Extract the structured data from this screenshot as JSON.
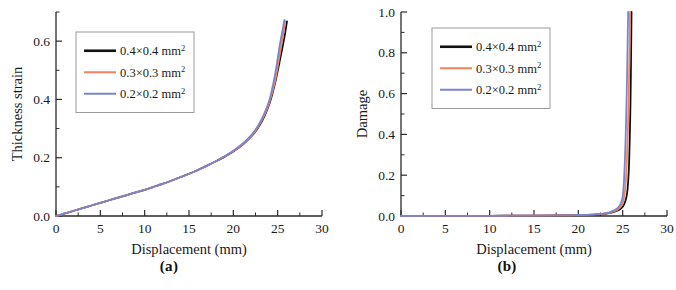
{
  "figure": {
    "panel_a_caption": "(a)",
    "panel_b_caption": "(b)"
  },
  "legend": {
    "entries": [
      {
        "base": "0.4×0.4 mm",
        "sup": "2",
        "color": "#111111"
      },
      {
        "base": "0.3×0.3 mm",
        "sup": "2",
        "color": "#f4825e"
      },
      {
        "base": "0.2×0.2 mm",
        "sup": "2",
        "color": "#7b85c9"
      }
    ]
  },
  "chart_data": [
    {
      "type": "line",
      "title": "",
      "panel": "(a)",
      "xlabel": "Displacement (mm)",
      "ylabel": "Thickness strain",
      "xlim": [
        0,
        30
      ],
      "ylim": [
        0,
        0.7
      ],
      "xticks": [
        0,
        5,
        10,
        15,
        20,
        25,
        30
      ],
      "xticklabels": [
        "0",
        "5",
        "10",
        "15",
        "20",
        "25",
        "30"
      ],
      "yticks": [
        0.0,
        0.2,
        0.4,
        0.6
      ],
      "yticklabels": [
        "0.0",
        "0.2",
        "0.4",
        "0.6"
      ],
      "x_minor_step": 2.5,
      "y_minor_step": 0.1,
      "grid": false,
      "legend_position": "upper left",
      "series": [
        {
          "name": "0.4×0.4 mm2",
          "color": "#111111",
          "x": [
            0,
            0.5,
            1,
            1.5,
            2,
            3,
            4,
            5,
            6,
            7,
            8,
            9,
            10,
            11,
            12,
            13,
            14,
            15,
            16,
            17,
            18,
            19,
            20,
            21,
            22,
            22.5,
            23,
            23.5,
            24,
            24.4,
            24.8,
            25.1,
            25.4,
            25.6,
            25.8,
            25.95,
            26.05
          ],
          "y": [
            0,
            0.004,
            0.009,
            0.013,
            0.018,
            0.027,
            0.036,
            0.045,
            0.054,
            0.063,
            0.072,
            0.081,
            0.09,
            0.1,
            0.11,
            0.121,
            0.133,
            0.145,
            0.158,
            0.172,
            0.187,
            0.203,
            0.221,
            0.243,
            0.272,
            0.29,
            0.313,
            0.342,
            0.379,
            0.419,
            0.468,
            0.512,
            0.557,
            0.588,
            0.62,
            0.648,
            0.668
          ]
        },
        {
          "name": "0.3×0.3 mm2",
          "color": "#f4825e",
          "x": [
            0,
            0.5,
            1,
            1.5,
            2,
            3,
            4,
            5,
            6,
            7,
            8,
            9,
            10,
            11,
            12,
            13,
            14,
            15,
            16,
            17,
            18,
            19,
            20,
            21,
            22,
            22.5,
            23,
            23.5,
            24,
            24.4,
            24.8,
            25.05,
            25.3,
            25.5,
            25.65,
            25.78,
            25.85
          ],
          "y": [
            0,
            0.004,
            0.009,
            0.013,
            0.018,
            0.027,
            0.036,
            0.045,
            0.054,
            0.063,
            0.072,
            0.081,
            0.09,
            0.1,
            0.11,
            0.121,
            0.133,
            0.145,
            0.158,
            0.172,
            0.187,
            0.204,
            0.222,
            0.244,
            0.274,
            0.292,
            0.316,
            0.346,
            0.384,
            0.425,
            0.476,
            0.521,
            0.567,
            0.601,
            0.629,
            0.655,
            0.669
          ]
        },
        {
          "name": "0.2×0.2 mm2",
          "color": "#7b85c9",
          "x": [
            0,
            0.5,
            1,
            1.5,
            2,
            3,
            4,
            5,
            6,
            7,
            8,
            9,
            10,
            11,
            12,
            13,
            14,
            15,
            16,
            17,
            18,
            19,
            20,
            21,
            22,
            22.5,
            23,
            23.5,
            24,
            24.35,
            24.7,
            24.95,
            25.18,
            25.38,
            25.55,
            25.68,
            25.76
          ],
          "y": [
            0,
            0.004,
            0.009,
            0.013,
            0.018,
            0.027,
            0.036,
            0.045,
            0.054,
            0.063,
            0.072,
            0.081,
            0.09,
            0.1,
            0.11,
            0.121,
            0.133,
            0.145,
            0.158,
            0.173,
            0.188,
            0.205,
            0.224,
            0.247,
            0.277,
            0.296,
            0.321,
            0.352,
            0.391,
            0.432,
            0.484,
            0.53,
            0.576,
            0.61,
            0.637,
            0.66,
            0.672
          ]
        }
      ]
    },
    {
      "type": "line",
      "title": "",
      "panel": "(b)",
      "xlabel": "Displacement (mm)",
      "ylabel": "Damage",
      "xlim": [
        0,
        30
      ],
      "ylim": [
        0,
        1.0
      ],
      "xticks": [
        0,
        5,
        10,
        15,
        20,
        25,
        30
      ],
      "xticklabels": [
        "0",
        "5",
        "10",
        "15",
        "20",
        "25",
        "30"
      ],
      "yticks": [
        0.0,
        0.2,
        0.4,
        0.6,
        0.8,
        1.0
      ],
      "yticklabels": [
        "0.0",
        "0.2",
        "0.4",
        "0.6",
        "0.8",
        "1.0"
      ],
      "x_minor_step": 2.5,
      "y_minor_step": 0.1,
      "grid": false,
      "legend_position": "upper left",
      "series": [
        {
          "name": "0.4×0.4 mm2",
          "color": "#111111",
          "x": [
            0,
            5,
            10,
            15,
            18,
            20,
            21,
            22,
            23,
            23.6,
            24.1,
            24.5,
            24.8,
            25.0,
            25.2,
            25.4,
            25.55,
            25.7,
            25.8,
            25.88,
            25.93,
            25.97,
            26.0
          ],
          "y": [
            0,
            0.0005,
            0.001,
            0.002,
            0.003,
            0.004,
            0.005,
            0.007,
            0.011,
            0.015,
            0.021,
            0.028,
            0.036,
            0.045,
            0.06,
            0.088,
            0.13,
            0.23,
            0.38,
            0.55,
            0.71,
            0.87,
            1.0
          ]
        },
        {
          "name": "0.3×0.3 mm2",
          "color": "#f4825e",
          "x": [
            0,
            5,
            10,
            15,
            18,
            20,
            21,
            22,
            23,
            23.6,
            24.0,
            24.35,
            24.6,
            24.8,
            25.0,
            25.15,
            25.3,
            25.45,
            25.58,
            25.68,
            25.75,
            25.8,
            25.83
          ],
          "y": [
            0,
            0.0005,
            0.001,
            0.002,
            0.003,
            0.004,
            0.006,
            0.008,
            0.012,
            0.017,
            0.023,
            0.03,
            0.038,
            0.047,
            0.063,
            0.09,
            0.14,
            0.25,
            0.41,
            0.58,
            0.74,
            0.89,
            1.0
          ]
        },
        {
          "name": "0.2×0.2 mm2",
          "color": "#7b85c9",
          "x": [
            0,
            5,
            10,
            15,
            18,
            20,
            21,
            22,
            23,
            23.5,
            23.9,
            24.2,
            24.45,
            24.65,
            24.85,
            25.0,
            25.12,
            25.25,
            25.37,
            25.46,
            25.53,
            25.58,
            25.62
          ],
          "y": [
            0,
            0.0005,
            0.001,
            0.002,
            0.003,
            0.005,
            0.006,
            0.009,
            0.013,
            0.018,
            0.025,
            0.032,
            0.04,
            0.05,
            0.067,
            0.095,
            0.15,
            0.27,
            0.44,
            0.61,
            0.77,
            0.91,
            1.0
          ]
        }
      ]
    }
  ]
}
